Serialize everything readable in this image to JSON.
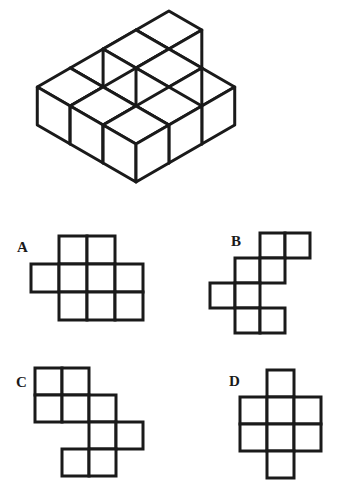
{
  "puzzle": {
    "type": "spatial-reasoning-cube-net",
    "stroke_color": "#1a1a1a",
    "fill_color": "#ffffff",
    "background": "#ffffff"
  },
  "figure": {
    "name": "isometric-cube-stack",
    "cube_size": 38,
    "origin_x": 136,
    "origin_y": 68,
    "cubes": [
      {
        "x": 0,
        "y": 0,
        "z": 0
      },
      {
        "x": 1,
        "y": 0,
        "z": 0
      },
      {
        "x": 2,
        "y": 0,
        "z": 0
      },
      {
        "x": 0,
        "y": 1,
        "z": 0
      },
      {
        "x": 1,
        "y": 1,
        "z": 0
      },
      {
        "x": 2,
        "y": 1,
        "z": 0
      },
      {
        "x": 1,
        "y": 0,
        "z": 1
      },
      {
        "x": 1,
        "y": 1,
        "z": 1
      },
      {
        "x": 2,
        "y": 1,
        "z": 1
      },
      {
        "x": 0,
        "y": 2,
        "z": 0
      },
      {
        "x": 1,
        "y": 2,
        "z": 0
      },
      {
        "x": 2,
        "y": 2,
        "z": 0
      }
    ]
  },
  "options": [
    {
      "id": "A",
      "label": "A",
      "name": "option-a",
      "cell": 28,
      "cols": 4,
      "rows": 3,
      "cells": [
        [
          0,
          1,
          1,
          0
        ],
        [
          1,
          1,
          1,
          1
        ],
        [
          0,
          1,
          1,
          1
        ]
      ]
    },
    {
      "id": "B",
      "label": "B",
      "name": "option-b",
      "cell": 25,
      "cols": 4,
      "rows": 4,
      "cells": [
        [
          0,
          0,
          1,
          1
        ],
        [
          0,
          1,
          1,
          0
        ],
        [
          1,
          1,
          0,
          0
        ],
        [
          0,
          1,
          1,
          0
        ]
      ]
    },
    {
      "id": "C",
      "label": "C",
      "name": "option-c",
      "cell": 27,
      "cols": 4,
      "rows": 4,
      "cells": [
        [
          1,
          1,
          0,
          0
        ],
        [
          1,
          1,
          1,
          0
        ],
        [
          0,
          0,
          1,
          1
        ],
        [
          0,
          1,
          1,
          0
        ]
      ]
    },
    {
      "id": "D",
      "label": "D",
      "name": "option-d",
      "cell": 27,
      "cols": 3,
      "rows": 4,
      "cells": [
        [
          0,
          1,
          0
        ],
        [
          1,
          1,
          1
        ],
        [
          1,
          1,
          1
        ],
        [
          0,
          1,
          0
        ]
      ]
    }
  ]
}
